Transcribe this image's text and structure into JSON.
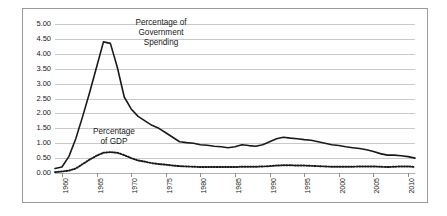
{
  "figure": {
    "background_color": "#ffffff",
    "frame_color": "#9a9a9a",
    "gridline_color": "#c9c9c9"
  },
  "annotations": {
    "government_spending": "Percentage of\nGovernment\nSpending",
    "gdp": "Percentage\nof GDP"
  },
  "chart_data": {
    "type": "line",
    "title": "",
    "xlabel": "",
    "ylabel": "",
    "xlim": [
      1959,
      2011
    ],
    "ylim": [
      0.0,
      5.0
    ],
    "grid": true,
    "legend_position": "inline-annotations",
    "ytick_labels": [
      "5.00",
      "4.50",
      "4.00",
      "3.50",
      "3.00",
      "2.50",
      "2.00",
      "1.50",
      "1.00",
      "0.50",
      "0.00"
    ],
    "ytick_values": [
      5.0,
      4.5,
      4.0,
      3.5,
      3.0,
      2.5,
      2.0,
      1.5,
      1.0,
      0.5,
      0.0
    ],
    "xtick_labels": [
      "1960",
      "1965",
      "1970",
      "1975",
      "1980",
      "1985",
      "1990",
      "1995",
      "2000",
      "2005",
      "2010"
    ],
    "xtick_values": [
      1960,
      1965,
      1970,
      1975,
      1980,
      1985,
      1990,
      1995,
      2000,
      2005,
      2010
    ],
    "x": [
      1959,
      1960,
      1961,
      1962,
      1963,
      1964,
      1965,
      1966,
      1967,
      1968,
      1969,
      1970,
      1971,
      1972,
      1973,
      1974,
      1975,
      1976,
      1977,
      1978,
      1979,
      1980,
      1981,
      1982,
      1983,
      1984,
      1985,
      1986,
      1987,
      1988,
      1989,
      1990,
      1991,
      1992,
      1993,
      1994,
      1995,
      1996,
      1997,
      1998,
      1999,
      2000,
      2001,
      2002,
      2003,
      2004,
      2005,
      2006,
      2007,
      2008,
      2009,
      2010,
      2011
    ],
    "series": [
      {
        "name": "Percentage of Government Spending",
        "style": "solid",
        "color": "#1a1a1a",
        "values": [
          0.15,
          0.2,
          0.55,
          1.15,
          1.9,
          2.7,
          3.55,
          4.4,
          4.35,
          3.55,
          2.55,
          2.15,
          1.9,
          1.75,
          1.6,
          1.5,
          1.35,
          1.2,
          1.05,
          1.02,
          1.0,
          0.95,
          0.93,
          0.9,
          0.88,
          0.85,
          0.88,
          0.95,
          0.92,
          0.9,
          0.95,
          1.05,
          1.15,
          1.2,
          1.17,
          1.15,
          1.12,
          1.1,
          1.05,
          1.0,
          0.95,
          0.92,
          0.88,
          0.85,
          0.82,
          0.78,
          0.72,
          0.65,
          0.6,
          0.6,
          0.58,
          0.55,
          0.5
        ]
      },
      {
        "name": "Percentage of GDP",
        "style": "dotted",
        "color": "#1a1a1a",
        "values": [
          0.03,
          0.05,
          0.08,
          0.15,
          0.3,
          0.45,
          0.58,
          0.68,
          0.7,
          0.68,
          0.6,
          0.5,
          0.42,
          0.38,
          0.33,
          0.3,
          0.28,
          0.25,
          0.23,
          0.22,
          0.21,
          0.2,
          0.2,
          0.2,
          0.2,
          0.2,
          0.2,
          0.21,
          0.21,
          0.21,
          0.22,
          0.23,
          0.25,
          0.26,
          0.26,
          0.25,
          0.25,
          0.24,
          0.23,
          0.22,
          0.21,
          0.21,
          0.21,
          0.21,
          0.22,
          0.22,
          0.22,
          0.21,
          0.2,
          0.21,
          0.22,
          0.22,
          0.2
        ]
      }
    ]
  }
}
